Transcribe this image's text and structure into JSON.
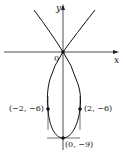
{
  "figure": {
    "type": "parametric-curve",
    "axes": {
      "x_label": "x",
      "y_label": "y",
      "origin_label": "0"
    },
    "points": [
      {
        "label": "(−2, −6)",
        "x": -2,
        "y": -6
      },
      {
        "label": "(2, −6)",
        "x": 2,
        "y": -6
      },
      {
        "label": "(0, −9)",
        "x": 0,
        "y": -9
      }
    ],
    "colors": {
      "curve": "#111111",
      "axes": "#222222",
      "background": "#ffffff"
    }
  }
}
